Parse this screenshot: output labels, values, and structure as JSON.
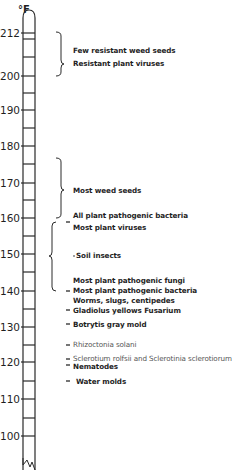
{
  "unit": "°F",
  "scale": {
    "labels": [
      "212",
      "200",
      "190",
      "180",
      "170",
      "160",
      "150",
      "140",
      "130",
      "120",
      "110",
      "100"
    ],
    "values": [
      212,
      200,
      190,
      180,
      170,
      160,
      150,
      140,
      130,
      120,
      110,
      100
    ]
  },
  "entries": [
    {
      "text": "Few resistant weed seeds",
      "temp_range": "~200-212"
    },
    {
      "text": "Resistant plant viruses",
      "temp_range": "~200-212"
    },
    {
      "text": "Most weed seeds",
      "temp_range": "~160-176"
    },
    {
      "text": "All plant pathogenic bacteria",
      "temp_range": "~160"
    },
    {
      "text": "Most plant viruses",
      "temp_range": "~140-158"
    },
    {
      "text": "Soil insects",
      "temp_range": "~150"
    },
    {
      "text": "Most plant pathogenic fungi",
      "temp_range": "~140-158"
    },
    {
      "text": "Most plant pathogenic bacteria",
      "temp_range": "~140"
    },
    {
      "text": "Worms, slugs, centipedes",
      "temp_range": "~138"
    },
    {
      "text": "Gladiolus yellows Fusarium",
      "temp_range": "~135"
    },
    {
      "text": "Botrytis gray mold",
      "temp_range": "~130"
    },
    {
      "text": "Rhizoctonia solani",
      "temp_range": "~125"
    },
    {
      "text": "Sclerotium rolfsii and Sclerotinia sclerotiorum",
      "temp_range": "~122"
    },
    {
      "text": "Nematodes",
      "temp_range": "~120"
    },
    {
      "text": "Water molds",
      "temp_range": "~115"
    }
  ]
}
